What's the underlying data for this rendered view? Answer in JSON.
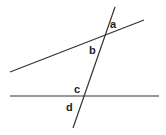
{
  "diagram": {
    "type": "transversal-angles",
    "stroke_color": "#333333",
    "lines": [
      {
        "id": "upper-line",
        "x1": 10,
        "y1": 72,
        "x2": 144,
        "y2": 20
      },
      {
        "id": "lower-line",
        "x1": 10,
        "y1": 96,
        "x2": 159,
        "y2": 96
      },
      {
        "id": "transversal",
        "x1": 115,
        "y1": 7,
        "x2": 73,
        "y2": 128
      }
    ],
    "labels": [
      {
        "id": "a",
        "text": "a",
        "x": 110,
        "y": 28
      },
      {
        "id": "b",
        "text": "b",
        "x": 89,
        "y": 54
      },
      {
        "id": "c",
        "text": "c",
        "x": 74,
        "y": 93
      },
      {
        "id": "d",
        "text": "d",
        "x": 66,
        "y": 111
      }
    ]
  }
}
